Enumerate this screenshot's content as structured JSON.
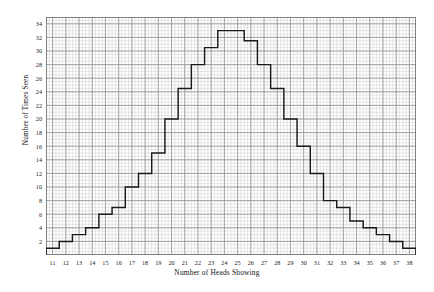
{
  "chart_data": {
    "type": "bar",
    "title": "",
    "subtitle": "",
    "xlabel": "Number of Heads Showing",
    "ylabel": "Number of Times Seen",
    "categories": [
      11,
      12,
      13,
      14,
      15,
      16,
      17,
      18,
      19,
      20,
      21,
      22,
      23,
      24,
      25,
      26,
      27,
      28,
      29,
      30,
      31,
      32,
      33,
      34,
      35,
      36,
      37,
      38
    ],
    "values": [
      1,
      2,
      3,
      4,
      6,
      7,
      10,
      12,
      15,
      20,
      24.5,
      28,
      30.5,
      33,
      33,
      31.5,
      28,
      24.5,
      20,
      16,
      12,
      8,
      7,
      5,
      4,
      3,
      2,
      1
    ],
    "xlim": [
      10.5,
      38.5
    ],
    "ylim": [
      0,
      35
    ],
    "ytick_labels": [
      "2",
      "4",
      "6",
      "8",
      "10",
      "12",
      "14",
      "16",
      "18",
      "20",
      "22",
      "24",
      "26",
      "28",
      "30",
      "32",
      "34"
    ],
    "ytick_values": [
      2,
      4,
      6,
      8,
      10,
      12,
      14,
      16,
      18,
      20,
      22,
      24,
      26,
      28,
      30,
      32,
      34
    ],
    "xtick_labels": [
      "11",
      "12",
      "13",
      "14",
      "15",
      "16",
      "17",
      "18",
      "19",
      "20",
      "21",
      "22",
      "23",
      "24",
      "25",
      "26",
      "27",
      "28",
      "29",
      "30",
      "31",
      "32",
      "33",
      "34",
      "35",
      "36",
      "37",
      "38"
    ],
    "grid": "on",
    "grid_minor_step_x": 0.25,
    "grid_minor_step_y": 0.5,
    "legend": "none",
    "legend_position": "none",
    "render": "step-outline",
    "colors": {
      "line": "#1a1a1a",
      "grid_major": "#8e8e8e",
      "grid_minor": "#c9c9c9",
      "frame": "#707070",
      "background": "#ffffff"
    }
  }
}
